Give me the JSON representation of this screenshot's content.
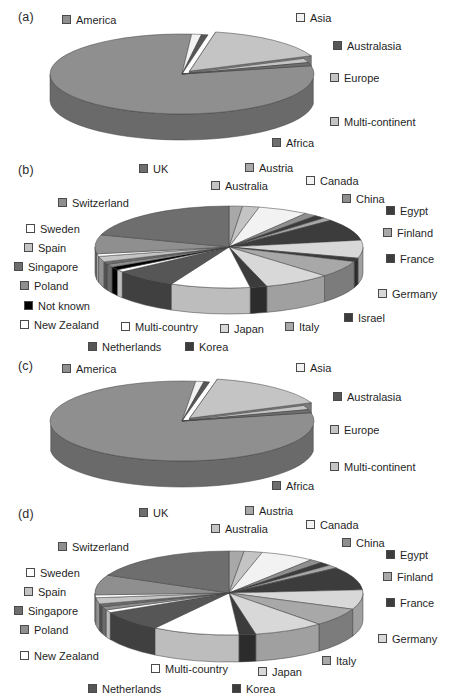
{
  "figure": {
    "panels": [
      "(a)",
      "(b)",
      "(c)",
      "(d)"
    ]
  },
  "palette": {
    "white": "#ffffff",
    "near_white": "#f2f2f2",
    "light": "#d8d8d8",
    "light_mid": "#c4c4c4",
    "mid": "#a8a8a8",
    "mid_dark": "#8f8f8f",
    "dark": "#6e6e6e",
    "darker": "#565656",
    "very_dark": "#3c3c3c",
    "black": "#000000",
    "edge": "#4a4a4a"
  },
  "panel_a": {
    "label": "(a)",
    "legend": [
      {
        "name": "America",
        "color": "#8f8f8f",
        "x": 62,
        "y": 14
      },
      {
        "name": "Asia",
        "color": "#f2f2f2",
        "x": 296,
        "y": 12
      },
      {
        "name": "Australasia",
        "color": "#565656",
        "x": 333,
        "y": 40
      },
      {
        "name": "Europe",
        "color": "#c4c4c4",
        "x": 330,
        "y": 72
      },
      {
        "name": "Multi-continent",
        "color": "#c4c4c4",
        "x": 330,
        "y": 116
      },
      {
        "name": "Africa",
        "color": "#6e6e6e",
        "x": 272,
        "y": 137
      }
    ]
  },
  "panel_b": {
    "label": "(b)",
    "legend": [
      {
        "name": "UK",
        "color": "#6e6e6e",
        "x": 139,
        "y": 8
      },
      {
        "name": "Austria",
        "color": "#a8a8a8",
        "x": 245,
        "y": 7
      },
      {
        "name": "Canada",
        "color": "#f2f2f2",
        "x": 306,
        "y": 20
      },
      {
        "name": "Australia",
        "color": "#c4c4c4",
        "x": 211,
        "y": 25
      },
      {
        "name": "China",
        "color": "#8f8f8f",
        "x": 342,
        "y": 38
      },
      {
        "name": "Switzerland",
        "color": "#8f8f8f",
        "x": 58,
        "y": 42
      },
      {
        "name": "Egypt",
        "color": "#3c3c3c",
        "x": 386,
        "y": 50
      },
      {
        "name": "Finland",
        "color": "#a8a8a8",
        "x": 383,
        "y": 72
      },
      {
        "name": "Sweden",
        "color": "#ffffff",
        "x": 26,
        "y": 68
      },
      {
        "name": "Spain",
        "color": "#c4c4c4",
        "x": 24,
        "y": 87
      },
      {
        "name": "France",
        "color": "#3c3c3c",
        "x": 386,
        "y": 98
      },
      {
        "name": "Singapore",
        "color": "#6e6e6e",
        "x": 14,
        "y": 106
      },
      {
        "name": "Poland",
        "color": "#8f8f8f",
        "x": 20,
        "y": 125
      },
      {
        "name": "Germany",
        "color": "#d8d8d8",
        "x": 378,
        "y": 133
      },
      {
        "name": "Not known",
        "color": "#000000",
        "x": 24,
        "y": 145
      },
      {
        "name": "New Zealand",
        "color": "#ffffff",
        "x": 20,
        "y": 164
      },
      {
        "name": "Multi-country",
        "color": "#ffffff",
        "x": 121,
        "y": 166
      },
      {
        "name": "Japan",
        "color": "#d8d8d8",
        "x": 220,
        "y": 168
      },
      {
        "name": "Italy",
        "color": "#a8a8a8",
        "x": 285,
        "y": 166
      },
      {
        "name": "Israel",
        "color": "#3c3c3c",
        "x": 344,
        "y": 157
      },
      {
        "name": "Netherlands",
        "color": "#565656",
        "x": 88,
        "y": 186
      },
      {
        "name": "Korea",
        "color": "#3c3c3c",
        "x": 185,
        "y": 186
      }
    ]
  },
  "panel_c": {
    "label": "(c)",
    "legend": [
      {
        "name": "America",
        "color": "#8f8f8f",
        "x": 62,
        "y": 10
      },
      {
        "name": "Asia",
        "color": "#f2f2f2",
        "x": 296,
        "y": 9
      },
      {
        "name": "Australasia",
        "color": "#565656",
        "x": 333,
        "y": 38
      },
      {
        "name": "Europe",
        "color": "#c4c4c4",
        "x": 330,
        "y": 71
      },
      {
        "name": "Multi-continent",
        "color": "#c4c4c4",
        "x": 330,
        "y": 108
      },
      {
        "name": "Africa",
        "color": "#6e6e6e",
        "x": 272,
        "y": 127
      }
    ]
  },
  "panel_d": {
    "label": "(d)",
    "legend": [
      {
        "name": "UK",
        "color": "#6e6e6e",
        "x": 139,
        "y": 14
      },
      {
        "name": "Austria",
        "color": "#a8a8a8",
        "x": 245,
        "y": 12
      },
      {
        "name": "Canada",
        "color": "#f2f2f2",
        "x": 306,
        "y": 26
      },
      {
        "name": "Australia",
        "color": "#c4c4c4",
        "x": 211,
        "y": 30
      },
      {
        "name": "China",
        "color": "#8f8f8f",
        "x": 342,
        "y": 44
      },
      {
        "name": "Switzerland",
        "color": "#8f8f8f",
        "x": 58,
        "y": 48
      },
      {
        "name": "Egypt",
        "color": "#3c3c3c",
        "x": 386,
        "y": 56
      },
      {
        "name": "Finland",
        "color": "#a8a8a8",
        "x": 383,
        "y": 78
      },
      {
        "name": "Sweden",
        "color": "#ffffff",
        "x": 26,
        "y": 74
      },
      {
        "name": "Spain",
        "color": "#c4c4c4",
        "x": 24,
        "y": 93
      },
      {
        "name": "France",
        "color": "#3c3c3c",
        "x": 386,
        "y": 104
      },
      {
        "name": "Singapore",
        "color": "#6e6e6e",
        "x": 14,
        "y": 112
      },
      {
        "name": "Poland",
        "color": "#8f8f8f",
        "x": 20,
        "y": 131
      },
      {
        "name": "Germany",
        "color": "#d8d8d8",
        "x": 378,
        "y": 140
      },
      {
        "name": "New Zealand",
        "color": "#ffffff",
        "x": 20,
        "y": 157
      },
      {
        "name": "Multi-country",
        "color": "#ffffff",
        "x": 151,
        "y": 170
      },
      {
        "name": "Japan",
        "color": "#d8d8d8",
        "x": 258,
        "y": 173
      },
      {
        "name": "Italy",
        "color": "#a8a8a8",
        "x": 322,
        "y": 162
      },
      {
        "name": "Netherlands",
        "color": "#565656",
        "x": 88,
        "y": 190
      },
      {
        "name": "Korea",
        "color": "#3c3c3c",
        "x": 232,
        "y": 190
      }
    ]
  },
  "chart_data": [
    {
      "id": "a",
      "type": "pie",
      "title": "(a)",
      "three_d": true,
      "exploded": [
        "Europe"
      ],
      "categories": [
        "America",
        "Asia",
        "Australasia",
        "Europe",
        "Multi-continent",
        "Africa"
      ],
      "values": [
        79.5,
        1.2,
        0.8,
        15.5,
        1.7,
        1.3
      ],
      "colors": [
        "#8f8f8f",
        "#f2f2f2",
        "#565656",
        "#c4c4c4",
        "#c4c4c4",
        "#6e6e6e"
      ]
    },
    {
      "id": "b",
      "type": "pie",
      "title": "(b)",
      "three_d": true,
      "exploded": [],
      "categories": [
        "Austria",
        "Australia",
        "Canada",
        "China",
        "Egypt",
        "Finland",
        "France",
        "Germany",
        "Israel",
        "Italy",
        "Japan",
        "Korea",
        "Multi-country",
        "Netherlands",
        "New Zealand",
        "Not known",
        "Poland",
        "Singapore",
        "Spain",
        "Sweden",
        "Switzerland",
        "UK"
      ],
      "values": [
        1.6,
        2.0,
        6.0,
        1.5,
        1.3,
        1.2,
        8.5,
        7.0,
        1.4,
        6.5,
        8.0,
        2.0,
        9.5,
        7.5,
        1.0,
        1.2,
        1.2,
        1.0,
        2.2,
        1.0,
        7.4,
        20.0
      ],
      "colors": [
        "#a8a8a8",
        "#c4c4c4",
        "#f2f2f2",
        "#8f8f8f",
        "#3c3c3c",
        "#a8a8a8",
        "#3c3c3c",
        "#d8d8d8",
        "#3c3c3c",
        "#a8a8a8",
        "#d8d8d8",
        "#3c3c3c",
        "#ffffff",
        "#565656",
        "#ffffff",
        "#000000",
        "#8f8f8f",
        "#6e6e6e",
        "#c4c4c4",
        "#ffffff",
        "#8f8f8f",
        "#6e6e6e"
      ]
    },
    {
      "id": "c",
      "type": "pie",
      "title": "(c)",
      "three_d": true,
      "exploded": [
        "Europe"
      ],
      "categories": [
        "America",
        "Asia",
        "Australasia",
        "Europe",
        "Multi-continent",
        "Africa"
      ],
      "values": [
        80.0,
        1.0,
        0.7,
        15.3,
        1.7,
        1.3
      ],
      "colors": [
        "#8f8f8f",
        "#f2f2f2",
        "#565656",
        "#c4c4c4",
        "#c4c4c4",
        "#6e6e6e"
      ]
    },
    {
      "id": "d",
      "type": "pie",
      "title": "(d)",
      "three_d": true,
      "exploded": [],
      "categories": [
        "Austria",
        "Australia",
        "Canada",
        "China",
        "Egypt",
        "Finland",
        "France",
        "Germany",
        "Italy",
        "Japan",
        "Korea",
        "Multi-country",
        "Netherlands",
        "New Zealand",
        "Poland",
        "Singapore",
        "Spain",
        "Sweden",
        "Switzerland",
        "UK"
      ],
      "values": [
        1.8,
        2.2,
        6.5,
        1.6,
        1.4,
        1.3,
        9.0,
        7.5,
        7.0,
        8.5,
        2.0,
        10.5,
        8.0,
        1.1,
        1.3,
        1.1,
        2.4,
        1.1,
        7.7,
        18.0
      ],
      "colors": [
        "#a8a8a8",
        "#c4c4c4",
        "#f2f2f2",
        "#8f8f8f",
        "#3c3c3c",
        "#a8a8a8",
        "#3c3c3c",
        "#d8d8d8",
        "#a8a8a8",
        "#d8d8d8",
        "#3c3c3c",
        "#ffffff",
        "#565656",
        "#ffffff",
        "#8f8f8f",
        "#6e6e6e",
        "#c4c4c4",
        "#ffffff",
        "#8f8f8f",
        "#6e6e6e"
      ]
    }
  ]
}
